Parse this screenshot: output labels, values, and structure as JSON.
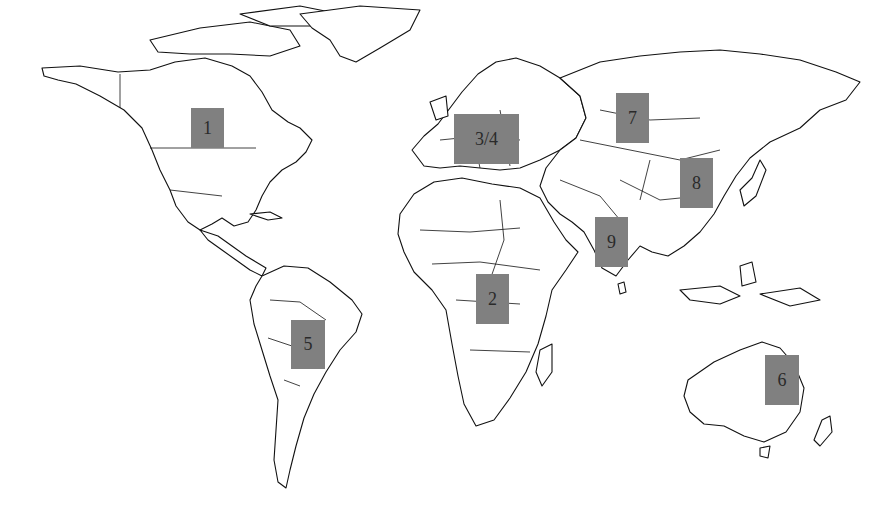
{
  "map": {
    "type": "world-outline-map",
    "background": "#ffffff",
    "marker_color": "#808080",
    "markers": [
      {
        "label": "1",
        "region": "North America (central Canada/US)",
        "x": 191,
        "y": 108,
        "w": 33,
        "h": 40
      },
      {
        "label": "3/4",
        "region": "Europe",
        "x": 454,
        "y": 114,
        "w": 65,
        "h": 50
      },
      {
        "label": "7",
        "region": "Central Asia / Mongolia",
        "x": 616,
        "y": 93,
        "w": 33,
        "h": 50
      },
      {
        "label": "8",
        "region": "Eastern China",
        "x": 680,
        "y": 158,
        "w": 33,
        "h": 50
      },
      {
        "label": "9",
        "region": "India",
        "x": 595,
        "y": 217,
        "w": 33,
        "h": 50
      },
      {
        "label": "2",
        "region": "Central Africa",
        "x": 476,
        "y": 274,
        "w": 33,
        "h": 50
      },
      {
        "label": "5",
        "region": "South America (Brazil)",
        "x": 291,
        "y": 320,
        "w": 34,
        "h": 49
      },
      {
        "label": "6",
        "region": "Eastern Australia",
        "x": 765,
        "y": 355,
        "w": 34,
        "h": 50
      }
    ]
  }
}
